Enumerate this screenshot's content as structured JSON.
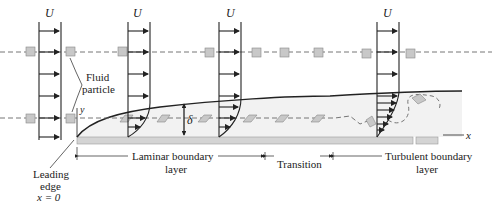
{
  "figure": {
    "labels": {
      "velocity_symbol": "U",
      "fluid_particle_line1": "Fluid",
      "fluid_particle_line2": "particle",
      "y_axis": "y",
      "x_axis": "x",
      "delta": "δ",
      "leading_edge_line1": "Leading",
      "leading_edge_line2": "edge",
      "leading_edge_line3": "x = 0",
      "laminar_line1": "Laminar boundary",
      "laminar_line2": "layer",
      "transition": "Transition",
      "turbulent_line1": "Turbulent boundary",
      "turbulent_line2": "layer"
    },
    "regions": [
      "Laminar boundary layer",
      "Transition",
      "Turbulent boundary layer"
    ],
    "colors": {
      "plate": "#d4d4d4",
      "boundary_layer_fill": "#f2f2f2",
      "particle": "#c8c8c8",
      "line": "#222222",
      "dashed": "#666666"
    }
  }
}
